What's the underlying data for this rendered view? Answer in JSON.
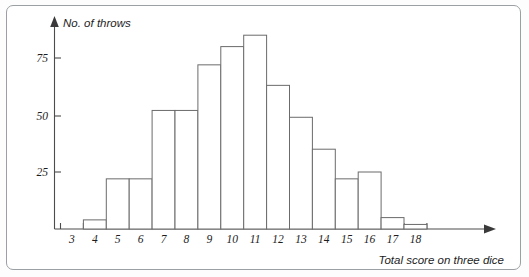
{
  "chart_data": {
    "type": "bar",
    "title": "",
    "subtitle": "",
    "xlabel": "Total score on three dice",
    "ylabel": "No. of throws",
    "categories": [
      "3",
      "4",
      "5",
      "6",
      "7",
      "8",
      "9",
      "10",
      "11",
      "12",
      "13",
      "14",
      "15",
      "16",
      "17",
      "18"
    ],
    "values": [
      0,
      4,
      22,
      22,
      52,
      52,
      72,
      80,
      85,
      63,
      49,
      35,
      22,
      25,
      5,
      2
    ],
    "bar_edges": [
      3.5,
      4.5,
      5.5,
      6.5,
      7.5,
      8.5,
      9.5,
      10.5,
      11.5,
      12.5,
      13.5,
      14.5,
      15.5,
      16.5,
      17.5,
      18.5
    ],
    "bars": [
      {
        "category": "4",
        "value": 4
      },
      {
        "category": "5",
        "value": 22
      },
      {
        "category": "6",
        "value": 22
      },
      {
        "category": "7",
        "value": 52
      },
      {
        "category": "8",
        "value": 52
      },
      {
        "category": "9",
        "value": 72
      },
      {
        "category": "10",
        "value": 80
      },
      {
        "category": "11",
        "value": 85
      },
      {
        "category": "12",
        "value": 63
      },
      {
        "category": "13",
        "value": 49
      },
      {
        "category": "14",
        "value": 35
      },
      {
        "category": "15",
        "value": 22
      },
      {
        "category": "16",
        "value": 25
      },
      {
        "category": "17",
        "value": 5
      },
      {
        "category": "18",
        "value": 2
      }
    ],
    "x_tick_labels": [
      "3",
      "4",
      "5",
      "6",
      "7",
      "8",
      "9",
      "10",
      "11",
      "12",
      "13",
      "14",
      "15",
      "16",
      "17",
      "18"
    ],
    "y_tick_labels": [
      "25",
      "50",
      "75"
    ],
    "y_tick_values": [
      25,
      50,
      75
    ],
    "ylim": [
      0,
      92
    ],
    "xlim": [
      2.5,
      19.4
    ],
    "grid": false,
    "legend": null,
    "legend_position": "none",
    "bar_fill_color": "#ffffff",
    "bar_edge_color": "#6b6b6b",
    "axis_color": "#4c4c4c",
    "axis_style": "arrow-ended open axes"
  },
  "axes": {
    "y_axis_name": "No. of throws",
    "x_axis_name": "Total score on three dice"
  }
}
